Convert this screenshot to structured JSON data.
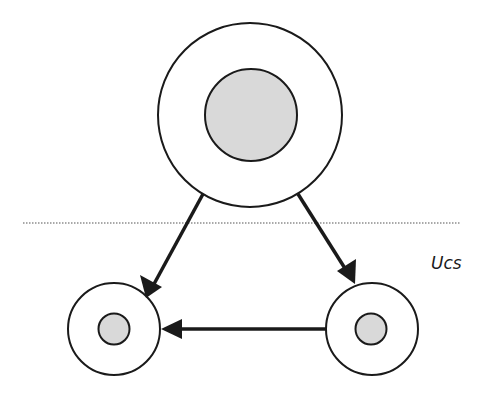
{
  "diagram": {
    "label": "Ucs",
    "colors": {
      "stroke": "#1a1a1a",
      "core_fill": "#d9d9d9",
      "outer_fill": "#ffffff",
      "divider": "#555555"
    },
    "nodes": [
      {
        "id": "top",
        "cx": 250,
        "cy": 115,
        "outer_r": 92,
        "inner_r": 46
      },
      {
        "id": "bottom-left",
        "cx": 114,
        "cy": 329,
        "outer_r": 46,
        "inner_r": 15.5
      },
      {
        "id": "bottom-right",
        "cx": 372,
        "cy": 329,
        "outer_r": 46,
        "inner_r": 15.5
      }
    ],
    "edges": [
      {
        "from": "top",
        "to": "bottom-left"
      },
      {
        "from": "top",
        "to": "bottom-right"
      },
      {
        "from": "bottom-right",
        "to": "bottom-left"
      }
    ],
    "divider": {
      "x1": 23,
      "x2": 460,
      "y": 223,
      "style": "dotted"
    }
  }
}
